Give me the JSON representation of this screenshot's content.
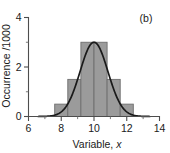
{
  "chart_data": {
    "type": "bar",
    "title": "",
    "panel_label": "(b)",
    "xlabel_prefix": "Variable, ",
    "xlabel_symbol": "x",
    "ylabel": "Occurrence /1000",
    "xlim": [
      6,
      14
    ],
    "ylim": [
      0,
      4
    ],
    "grid": false,
    "legend": false,
    "x_ticks_major": [
      6,
      8,
      10,
      12,
      14
    ],
    "x_ticks_major_labels": [
      "6",
      "8",
      "10",
      "12",
      "14"
    ],
    "x_ticks_minor": [
      7,
      9,
      11,
      13
    ],
    "y_ticks_major": [
      0,
      2,
      4
    ],
    "y_ticks_major_labels": [
      "0",
      "2",
      "4"
    ],
    "y_ticks_minor": [
      1,
      3
    ],
    "bin_width": 0.8,
    "bin_edges": [
      7.6,
      8.4,
      9.2,
      10.0,
      10.8,
      11.6,
      12.4
    ],
    "bar_left_edges": [
      7.6,
      8.4,
      9.2,
      10.0,
      10.8,
      11.6
    ],
    "categories": [
      "8.0",
      "8.8",
      "9.6",
      "10.4",
      "11.2",
      "12.0"
    ],
    "values": [
      0.5,
      1.5,
      3.0,
      3.0,
      1.5,
      0.5
    ],
    "curve": {
      "name": "Gaussian fit",
      "mean": 10.0,
      "sigma": 0.85,
      "peak": 3.0,
      "x_start": 6.6,
      "x_end": 13.4
    }
  }
}
